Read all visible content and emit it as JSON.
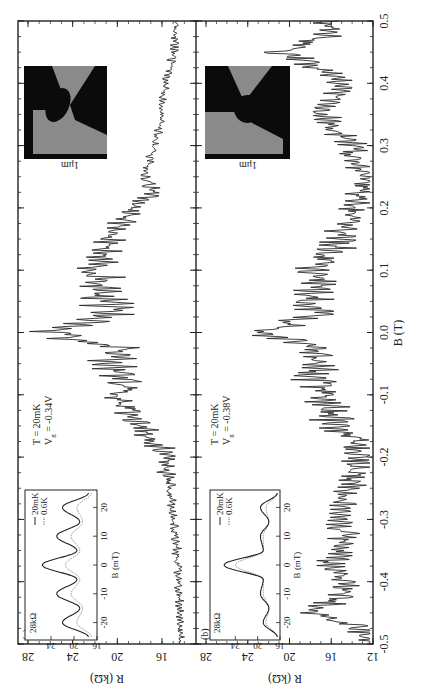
{
  "figure": {
    "xlabel": "B (T)",
    "ylabel": "R (kΩ)",
    "x_ticks": [
      "-0.5",
      "-0.4",
      "-0.3",
      "-0.2",
      "-0.1",
      "0.0",
      "0.1",
      "0.2",
      "0.3",
      "0.4",
      "0.5"
    ],
    "panel_a": {
      "label": "(a)",
      "y_ticks": [
        "28",
        "24",
        "20",
        "16"
      ],
      "annotation_T": "T = 20mK",
      "annotation_Vg": "V",
      "annotation_Vg_sub": "g",
      "annotation_Vg_value": " = -0.34V",
      "scale_label": "1μm",
      "inset": {
        "y_top_label": "28kΩ",
        "y_ticks": [
          "24",
          "20",
          "16"
        ],
        "x_ticks": [
          "-20",
          "-10",
          "0",
          "10",
          "20"
        ],
        "xlabel": "B (mT)",
        "legend": [
          "20mK",
          "0.6K"
        ]
      }
    },
    "panel_b": {
      "label": "(b)",
      "y_ticks": [
        "28",
        "24",
        "20",
        "16",
        "12"
      ],
      "annotation_T": "T = 20mK",
      "annotation_Vg": "V",
      "annotation_Vg_sub": "g",
      "annotation_Vg_value": " = -0.38V",
      "scale_label": "1μm",
      "inset": {
        "y_top_label": "28kΩ",
        "y_ticks": [
          "24",
          "20",
          "16"
        ],
        "x_ticks": [
          "-20",
          "-10",
          "0",
          "10",
          "20"
        ],
        "xlabel": "B (mT)",
        "legend": [
          "20mK",
          "0.6K"
        ]
      }
    }
  },
  "chart_data": [
    {
      "type": "line",
      "title": "(a) T = 20mK, Vg = -0.34V",
      "xlabel": "B (T)",
      "ylabel": "R (kΩ)",
      "xlim": [
        -0.5,
        0.5
      ],
      "ylim": [
        13,
        29
      ],
      "x": [
        -0.5,
        -0.45,
        -0.4,
        -0.35,
        -0.3,
        -0.25,
        -0.22,
        -0.2,
        -0.18,
        -0.15,
        -0.12,
        -0.1,
        -0.08,
        -0.05,
        -0.03,
        0.0,
        0.03,
        0.05,
        0.08,
        0.1,
        0.12,
        0.15,
        0.18,
        0.2,
        0.22,
        0.25,
        0.3,
        0.35,
        0.4,
        0.45,
        0.5
      ],
      "series": [
        {
          "name": "20mK",
          "values": [
            14.6,
            14.7,
            14.8,
            15.0,
            15.2,
            15.6,
            16.8,
            16.3,
            17.5,
            19.0,
            20.0,
            21.5,
            20.5,
            22.5,
            21.0,
            27.5,
            21.5,
            23.0,
            22.5,
            23.2,
            22.8,
            21.5,
            20.5,
            19.5,
            17.5,
            17.8,
            17.0,
            16.3,
            16.0,
            15.2,
            15.0
          ]
        }
      ],
      "annotations": [
        "T = 20mK",
        "Vg = -0.34V",
        "1μm"
      ]
    },
    {
      "type": "line",
      "title": "(a) inset",
      "xlabel": "B (mT)",
      "ylabel": "R (kΩ)",
      "xlim": [
        -25,
        25
      ],
      "ylim": [
        16,
        28
      ],
      "x": [
        -25,
        -20,
        -15,
        -10,
        -5,
        0,
        5,
        10,
        15,
        20,
        25
      ],
      "series": [
        {
          "name": "20mK",
          "values": [
            17.5,
            22.0,
            19.0,
            23.0,
            19.5,
            25.5,
            19.5,
            23.0,
            19.0,
            22.0,
            17.5
          ]
        },
        {
          "name": "0.6K",
          "values": [
            17.0,
            19.5,
            18.5,
            20.5,
            19.0,
            21.5,
            19.0,
            20.5,
            18.5,
            19.5,
            17.0
          ]
        }
      ],
      "legend": [
        "20mK",
        "0.6K"
      ]
    },
    {
      "type": "line",
      "title": "(b) T = 20mK, Vg = -0.38V",
      "xlabel": "B (T)",
      "ylabel": "R (kΩ)",
      "xlim": [
        -0.5,
        0.5
      ],
      "ylim": [
        12,
        28
      ],
      "x": [
        -0.5,
        -0.47,
        -0.45,
        -0.42,
        -0.4,
        -0.37,
        -0.35,
        -0.3,
        -0.25,
        -0.2,
        -0.17,
        -0.15,
        -0.12,
        -0.1,
        -0.07,
        -0.05,
        -0.02,
        0.0,
        0.03,
        0.05,
        0.08,
        0.1,
        0.15,
        0.2,
        0.25,
        0.3,
        0.35,
        0.38,
        0.4,
        0.43,
        0.45,
        0.48,
        0.5
      ],
      "series": [
        {
          "name": "20mK",
          "values": [
            13.0,
            14.5,
            19.5,
            15.5,
            16.0,
            17.5,
            16.0,
            16.0,
            15.5,
            14.5,
            15.0,
            17.0,
            18.0,
            17.5,
            19.5,
            18.5,
            19.5,
            24.5,
            19.0,
            19.5,
            18.5,
            19.0,
            16.5,
            15.0,
            14.0,
            15.5,
            18.0,
            17.0,
            16.0,
            19.0,
            22.0,
            17.0,
            18.0
          ]
        }
      ],
      "annotations": [
        "T = 20mK",
        "Vg = -0.38V",
        "1μm"
      ]
    },
    {
      "type": "line",
      "title": "(b) inset",
      "xlabel": "B (mT)",
      "ylabel": "R (kΩ)",
      "xlim": [
        -25,
        25
      ],
      "ylim": [
        16,
        28
      ],
      "x": [
        -25,
        -20,
        -15,
        -10,
        -5,
        0,
        5,
        10,
        15,
        20,
        25
      ],
      "series": [
        {
          "name": "20mK",
          "values": [
            16.5,
            19.0,
            18.0,
            19.5,
            19.0,
            26.0,
            19.0,
            19.5,
            18.0,
            19.5,
            16.5
          ]
        },
        {
          "name": "0.6K",
          "values": [
            16.5,
            18.5,
            18.0,
            19.0,
            19.0,
            24.0,
            19.0,
            19.0,
            18.0,
            18.5,
            16.5
          ]
        }
      ],
      "legend": [
        "20mK",
        "0.6K"
      ]
    }
  ]
}
